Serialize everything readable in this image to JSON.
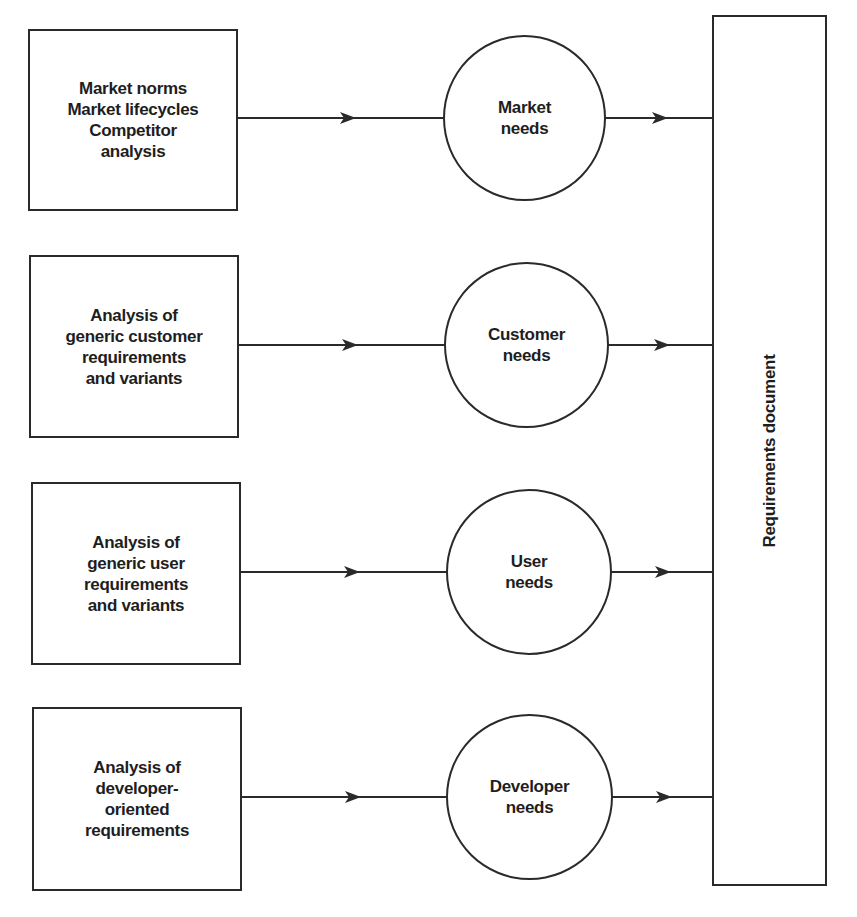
{
  "diagram": {
    "rows": [
      {
        "source": {
          "lines": [
            "Market norms",
            "Market lifecycles",
            "Competitor",
            "analysis"
          ]
        },
        "need": {
          "lines": [
            "Market",
            "needs"
          ]
        }
      },
      {
        "source": {
          "lines": [
            "Analysis of",
            "generic customer",
            "requirements",
            "and variants"
          ]
        },
        "need": {
          "lines": [
            "Customer",
            "needs"
          ]
        }
      },
      {
        "source": {
          "lines": [
            "Analysis of",
            "generic user",
            "requirements",
            "and variants"
          ]
        },
        "need": {
          "lines": [
            "User",
            "needs"
          ]
        }
      },
      {
        "source": {
          "lines": [
            "Analysis of",
            "developer-",
            "oriented",
            "requirements"
          ]
        },
        "need": {
          "lines": [
            "Developer",
            "needs"
          ]
        }
      }
    ],
    "target": {
      "label": "Requirements document"
    },
    "colors": {
      "stroke": "#2a2a2a",
      "text": "#1e1e1e",
      "background": "#ffffff"
    }
  }
}
